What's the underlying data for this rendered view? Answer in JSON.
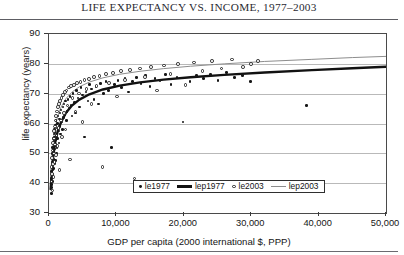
{
  "figure": {
    "title_leading": "L",
    "title": "IFE ",
    "title_full": "LIFE EXPECTANCY VS. INCOME, 1977–2003"
  },
  "chart_data": {
    "type": "scatter",
    "title": "LIFE EXPECTANCY VS. INCOME, 1977–2003",
    "xlabel": "GDP per capita (2000 international $, PPP)",
    "ylabel": "life expectancy (years)",
    "xlim": [
      0,
      50000
    ],
    "ylim": [
      30,
      90
    ],
    "xticks": [
      0,
      10000,
      20000,
      30000,
      40000,
      50000
    ],
    "xtick_labels": [
      "0",
      "10,000",
      "20,000",
      "30,000",
      "40,000",
      "50,000"
    ],
    "yticks": [
      30,
      40,
      50,
      60,
      70,
      80,
      90
    ],
    "ytick_labels": [
      "30",
      "40",
      "50",
      "60",
      "70",
      "80",
      "90"
    ],
    "grid": "horizontal",
    "legend_position": "inside-bottom-center",
    "legend": [
      {
        "name": "le1977",
        "kind": "marker",
        "marker": "filled-dot",
        "color": "#161616"
      },
      {
        "name": "lep1977",
        "kind": "line",
        "style": "thick",
        "color": "#121212"
      },
      {
        "name": "le2003",
        "kind": "marker",
        "marker": "open-circle",
        "color": "#232323"
      },
      {
        "name": "lep2003",
        "kind": "line",
        "style": "thin",
        "color": "#8d8d8d"
      }
    ],
    "series": [
      {
        "name": "le1977",
        "type": "scatter",
        "marker": "filled-dot",
        "points": [
          [
            330,
            41.5
          ],
          [
            360,
            38.5
          ],
          [
            380,
            44.0
          ],
          [
            400,
            36.5
          ],
          [
            420,
            42.5
          ],
          [
            440,
            45.5
          ],
          [
            450,
            39.5
          ],
          [
            470,
            47.0
          ],
          [
            480,
            43.0
          ],
          [
            500,
            48.5
          ],
          [
            510,
            40.5
          ],
          [
            530,
            50.0
          ],
          [
            540,
            46.0
          ],
          [
            560,
            52.0
          ],
          [
            570,
            44.5
          ],
          [
            590,
            49.0
          ],
          [
            600,
            53.5
          ],
          [
            620,
            47.5
          ],
          [
            640,
            51.0
          ],
          [
            660,
            55.0
          ],
          [
            680,
            45.0
          ],
          [
            700,
            50.5
          ],
          [
            720,
            54.0
          ],
          [
            740,
            48.0
          ],
          [
            760,
            56.5
          ],
          [
            780,
            52.5
          ],
          [
            800,
            46.5
          ],
          [
            820,
            58.0
          ],
          [
            840,
            51.5
          ],
          [
            860,
            55.5
          ],
          [
            880,
            49.5
          ],
          [
            900,
            57.0
          ],
          [
            930,
            53.0
          ],
          [
            960,
            59.5
          ],
          [
            980,
            47.5
          ],
          [
            1010,
            54.5
          ],
          [
            1050,
            61.0
          ],
          [
            1080,
            50.0
          ],
          [
            1120,
            56.0
          ],
          [
            1160,
            58.5
          ],
          [
            1200,
            52.0
          ],
          [
            1250,
            60.0
          ],
          [
            1300,
            55.0
          ],
          [
            1350,
            62.5
          ],
          [
            1400,
            57.5
          ],
          [
            1460,
            53.5
          ],
          [
            1520,
            61.5
          ],
          [
            1580,
            59.0
          ],
          [
            1650,
            63.5
          ],
          [
            1720,
            56.5
          ],
          [
            1800,
            64.5
          ],
          [
            1880,
            60.5
          ],
          [
            1960,
            58.0
          ],
          [
            2050,
            65.5
          ],
          [
            2150,
            62.0
          ],
          [
            2250,
            66.5
          ],
          [
            2350,
            63.0
          ],
          [
            2460,
            67.5
          ],
          [
            2580,
            61.0
          ],
          [
            2700,
            64.0
          ],
          [
            2830,
            68.0
          ],
          [
            2960,
            65.0
          ],
          [
            3100,
            69.0
          ],
          [
            3250,
            66.0
          ],
          [
            3400,
            62.5
          ],
          [
            3580,
            70.0
          ],
          [
            3750,
            67.0
          ],
          [
            3930,
            63.5
          ],
          [
            4120,
            71.0
          ],
          [
            4320,
            68.5
          ],
          [
            4520,
            65.5
          ],
          [
            4750,
            72.0
          ],
          [
            4980,
            69.5
          ],
          [
            5230,
            55.5
          ],
          [
            5480,
            70.5
          ],
          [
            5760,
            67.5
          ],
          [
            6040,
            73.0
          ],
          [
            6340,
            71.5
          ],
          [
            6650,
            68.0
          ],
          [
            6980,
            72.5
          ],
          [
            7320,
            66.5
          ],
          [
            7680,
            73.5
          ],
          [
            8050,
            70.0
          ],
          [
            8450,
            74.0
          ],
          [
            8860,
            71.0
          ],
          [
            9290,
            52.0
          ],
          [
            9750,
            73.0
          ],
          [
            10220,
            74.5
          ],
          [
            10720,
            72.0
          ],
          [
            11250,
            75.0
          ],
          [
            11800,
            70.5
          ],
          [
            12380,
            74.0
          ],
          [
            12980,
            75.5
          ],
          [
            13620,
            73.5
          ],
          [
            14280,
            76.0
          ],
          [
            14980,
            72.5
          ],
          [
            15720,
            75.0
          ],
          [
            16480,
            74.5
          ],
          [
            17280,
            76.5
          ],
          [
            18120,
            73.0
          ],
          [
            19000,
            75.5
          ],
          [
            19900,
            60.5
          ],
          [
            20900,
            74.0
          ],
          [
            21900,
            76.0
          ],
          [
            22900,
            75.0
          ],
          [
            24000,
            76.5
          ],
          [
            25100,
            74.5
          ],
          [
            26300,
            77.0
          ],
          [
            27500,
            75.5
          ],
          [
            28700,
            76.0
          ],
          [
            29900,
            74.0
          ],
          [
            38200,
            66.0
          ]
        ]
      },
      {
        "name": "le2003",
        "type": "scatter",
        "marker": "open-circle",
        "points": [
          [
            350,
            40.5
          ],
          [
            390,
            45.5
          ],
          [
            430,
            43.0
          ],
          [
            470,
            48.5
          ],
          [
            500,
            37.5
          ],
          [
            540,
            51.0
          ],
          [
            580,
            46.5
          ],
          [
            620,
            53.5
          ],
          [
            660,
            42.0
          ],
          [
            700,
            55.0
          ],
          [
            740,
            50.0
          ],
          [
            780,
            57.5
          ],
          [
            820,
            47.0
          ],
          [
            860,
            59.0
          ],
          [
            900,
            53.0
          ],
          [
            950,
            61.0
          ],
          [
            1000,
            49.5
          ],
          [
            1060,
            62.5
          ],
          [
            1120,
            56.0
          ],
          [
            1180,
            64.0
          ],
          [
            1250,
            52.5
          ],
          [
            1320,
            65.5
          ],
          [
            1400,
            58.5
          ],
          [
            1480,
            66.5
          ],
          [
            1560,
            44.5
          ],
          [
            1650,
            67.5
          ],
          [
            1750,
            61.0
          ],
          [
            1850,
            68.5
          ],
          [
            1960,
            55.5
          ],
          [
            2080,
            69.5
          ],
          [
            2200,
            63.5
          ],
          [
            2330,
            70.5
          ],
          [
            2470,
            58.0
          ],
          [
            2620,
            71.0
          ],
          [
            2770,
            66.0
          ],
          [
            2940,
            72.0
          ],
          [
            3110,
            48.0
          ],
          [
            3300,
            72.5
          ],
          [
            3500,
            68.5
          ],
          [
            3710,
            73.0
          ],
          [
            3930,
            64.0
          ],
          [
            4170,
            73.5
          ],
          [
            4420,
            70.0
          ],
          [
            4690,
            74.0
          ],
          [
            4970,
            60.5
          ],
          [
            5270,
            74.5
          ],
          [
            5590,
            71.5
          ],
          [
            5930,
            75.0
          ],
          [
            6290,
            66.5
          ],
          [
            6670,
            75.5
          ],
          [
            7070,
            72.5
          ],
          [
            7500,
            76.0
          ],
          [
            7950,
            45.5
          ],
          [
            8430,
            76.5
          ],
          [
            8940,
            73.5
          ],
          [
            9480,
            77.0
          ],
          [
            10050,
            69.0
          ],
          [
            10660,
            77.5
          ],
          [
            11300,
            74.5
          ],
          [
            11980,
            78.0
          ],
          [
            12700,
            41.5
          ],
          [
            13470,
            78.5
          ],
          [
            14280,
            75.5
          ],
          [
            15140,
            79.0
          ],
          [
            16050,
            71.0
          ],
          [
            17020,
            79.5
          ],
          [
            18040,
            76.5
          ],
          [
            19130,
            80.0
          ],
          [
            20280,
            73.0
          ],
          [
            21500,
            80.5
          ],
          [
            22790,
            77.5
          ],
          [
            24160,
            81.0
          ],
          [
            25610,
            78.5
          ],
          [
            27150,
            81.5
          ],
          [
            28780,
            79.0
          ],
          [
            30000,
            80.0
          ],
          [
            31000,
            81.0
          ]
        ]
      },
      {
        "name": "lep1977",
        "type": "line",
        "fit": "logarithmic",
        "style": "thick-dark",
        "points": [
          [
            250,
            38.0
          ],
          [
            400,
            43.5
          ],
          [
            600,
            48.5
          ],
          [
            900,
            53.5
          ],
          [
            1300,
            57.5
          ],
          [
            1800,
            60.5
          ],
          [
            2500,
            63.5
          ],
          [
            3400,
            66.0
          ],
          [
            4500,
            68.0
          ],
          [
            6000,
            69.8
          ],
          [
            8000,
            71.4
          ],
          [
            10500,
            72.7
          ],
          [
            13500,
            73.8
          ],
          [
            17000,
            74.7
          ],
          [
            21000,
            75.5
          ],
          [
            26000,
            76.3
          ],
          [
            32000,
            77.1
          ],
          [
            39000,
            77.9
          ],
          [
            45000,
            78.5
          ],
          [
            50000,
            79.0
          ]
        ]
      },
      {
        "name": "lep2003",
        "type": "line",
        "fit": "logarithmic",
        "style": "thin-gray",
        "points": [
          [
            250,
            42.0
          ],
          [
            400,
            48.0
          ],
          [
            600,
            53.5
          ],
          [
            900,
            58.5
          ],
          [
            1300,
            62.5
          ],
          [
            1800,
            65.5
          ],
          [
            2500,
            68.3
          ],
          [
            3400,
            70.5
          ],
          [
            4500,
            72.3
          ],
          [
            6000,
            73.9
          ],
          [
            8000,
            75.3
          ],
          [
            10500,
            76.5
          ],
          [
            13500,
            77.5
          ],
          [
            17000,
            78.4
          ],
          [
            21000,
            79.2
          ],
          [
            26000,
            80.0
          ],
          [
            32000,
            80.8
          ],
          [
            39000,
            81.5
          ],
          [
            45000,
            82.1
          ],
          [
            50000,
            82.5
          ]
        ]
      }
    ]
  }
}
